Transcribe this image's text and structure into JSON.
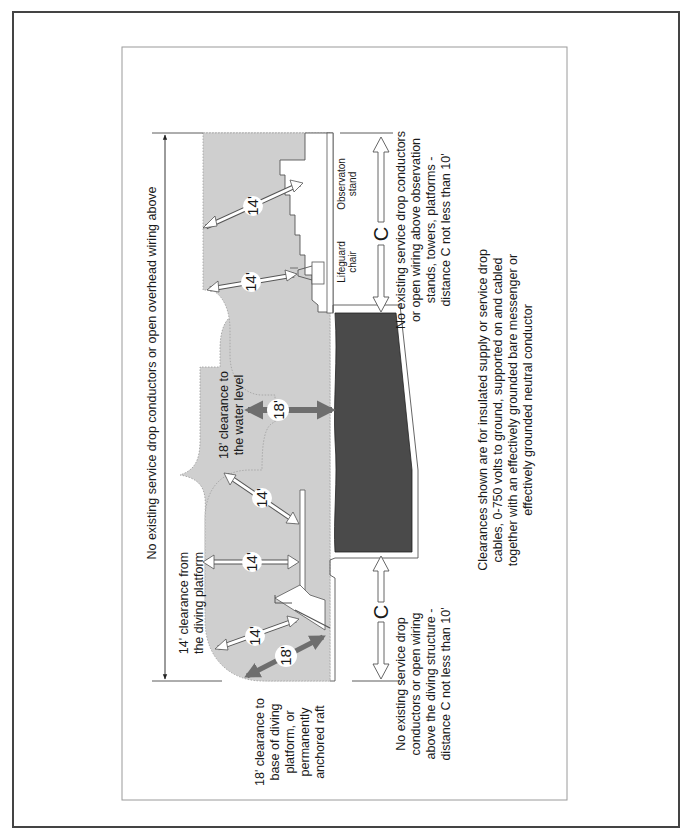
{
  "diagram": {
    "orientation": "rotated-90-ccw",
    "colors": {
      "clearance_zone": "#cfcfcf",
      "pool_water": "#4a4a4a",
      "structure": "#ffffff",
      "outline": "#555555",
      "clearance_arrow": "#ffffff",
      "water_arrow": "#6e6e6e",
      "outer_frame": "#444444",
      "inner_frame": "#9a9a9a"
    },
    "labels": {
      "overhead_wiring": "No existing service drop conductors or open overhead wiring above",
      "diving_platform_clearance": [
        "14' clearance from",
        "the diving platform"
      ],
      "water_level_clearance": [
        "18' clearance to",
        "the water level"
      ],
      "raft_clearance": [
        "18' clearance to",
        "base of diving",
        "platform, or",
        "permanently",
        "anchored raft"
      ],
      "diving_structure_note": [
        "No existing service drop",
        "conductors or open wiring",
        "above the diving structure -",
        "distance C not less than 10'"
      ],
      "observation_note": [
        "No existing service drop conductors",
        "or open wiring above observation",
        "stands, towers, platforms -",
        "distance C not less than 10'"
      ],
      "lifeguard_chair": [
        "Lifeguard",
        "chair"
      ],
      "observation_stand": [
        "Observaton",
        "stand"
      ],
      "footnote": [
        "Clearances shown are for insulated supply or service drop",
        "cables, 0-750 volts to ground, supported on and cabled",
        "together with an effectively grounded bare messenger or",
        "effectively grounded neutral conductor"
      ]
    },
    "dimensions": {
      "obs_stand_clearance": "14'",
      "lifeguard_clearance": "14'",
      "water_level": "18'",
      "diving_upper": "14'",
      "diving_mid": "14'",
      "diving_lower": "14'",
      "raft_base": "18'",
      "distance_c_top": "C",
      "distance_c_bottom": "C"
    }
  }
}
